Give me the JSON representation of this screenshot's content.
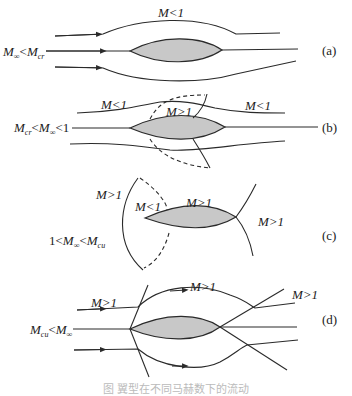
{
  "panels": [
    {
      "id": "a",
      "tag": "(a)",
      "condition": {
        "M": "M",
        "sub1": "∞",
        "op": "<",
        "M2": "M",
        "sub2": "cr",
        "tail": ""
      },
      "region_labels": [
        "M<1"
      ]
    },
    {
      "id": "b",
      "tag": "(b)",
      "condition": {
        "M": "M",
        "sub1": "cr",
        "op": "<",
        "M2": "M",
        "sub2": "∞",
        "tail": "<1"
      },
      "region_labels": [
        "M<1",
        "M>1",
        "M<1"
      ]
    },
    {
      "id": "c",
      "tag": "(c)",
      "condition": {
        "head": "1<",
        "M": "M",
        "sub1": "∞",
        "op": "<",
        "M2": "M",
        "sub2": "cu"
      },
      "region_labels": [
        "M>1",
        "M<1",
        "M>1",
        "M>1"
      ]
    },
    {
      "id": "d",
      "tag": "(d)",
      "condition": {
        "M": "M",
        "sub1": "cu",
        "op": "<",
        "M2": "M",
        "sub2": "∞"
      },
      "region_labels": [
        "M>1",
        "M>1",
        "M>1"
      ]
    }
  ],
  "colors": {
    "airfoil_fill": "#c8c8c8",
    "line": "#2a2a2a",
    "background": "#ffffff"
  },
  "caption": "图 翼型在不同马赫数下的流动"
}
